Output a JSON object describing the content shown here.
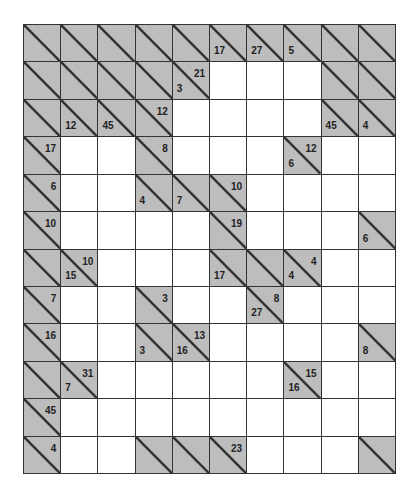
{
  "puzzle": {
    "type": "kakuro",
    "rows": 12,
    "cols": 10,
    "colors": {
      "clue_fill": "#bdbdbd",
      "blank_fill": "#ffffff",
      "line": "#333333"
    },
    "legend": "Each clue cell: number in upper-right = across sum, number in lower-left = down sum; '#' = clue/blocked cell, '.' = empty entry cell",
    "grid": [
      [
        "#",
        "#",
        "#",
        "#",
        "#",
        "#|17",
        "#|27",
        "#|5",
        "#",
        "#"
      ],
      [
        "#",
        "#",
        "#",
        "#",
        "21|3",
        ".",
        ".",
        ".",
        "#",
        "#"
      ],
      [
        "#",
        "#|12",
        "#|45",
        "12|",
        ".",
        ".",
        ".",
        ".",
        "#|45",
        "#|4"
      ],
      [
        "17|",
        ".",
        ".",
        "8|",
        ".",
        ".",
        ".",
        "12|6",
        ".",
        "."
      ],
      [
        "6|",
        ".",
        ".",
        "#|4",
        "#|7",
        "10|",
        ".",
        ".",
        ".",
        "."
      ],
      [
        "10|",
        ".",
        ".",
        ".",
        ".",
        "19|",
        ".",
        ".",
        ".",
        "#|6"
      ],
      [
        "#",
        "10|15",
        ".",
        ".",
        ".",
        "#|17",
        "#",
        "4|4",
        ".",
        "."
      ],
      [
        "7|",
        ".",
        ".",
        "3|",
        ".",
        ".",
        "8|27",
        ".",
        ".",
        "."
      ],
      [
        "16|",
        ".",
        ".",
        "#|3",
        "13|16",
        ".",
        ".",
        ".",
        ".",
        "#|8"
      ],
      [
        "#",
        "31|7",
        ".",
        ".",
        ".",
        ".",
        ".",
        "15|16",
        ".",
        "."
      ],
      [
        "45|",
        ".",
        ".",
        ".",
        ".",
        ".",
        ".",
        ".",
        ".",
        "."
      ],
      [
        "4|",
        ".",
        ".",
        "#",
        "#",
        "23|",
        ".",
        ".",
        ".",
        "#"
      ]
    ]
  }
}
